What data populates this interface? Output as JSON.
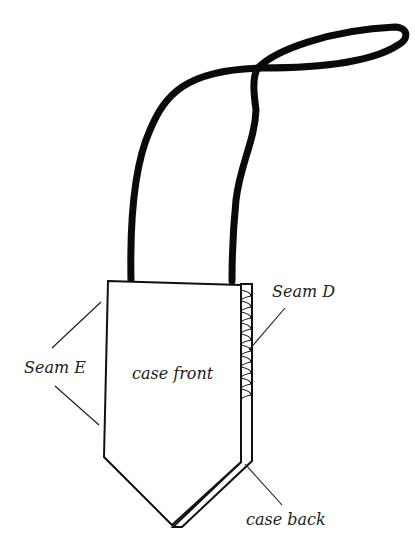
{
  "diagram": {
    "type": "sewing-illustration",
    "colors": {
      "background": "#ffffff",
      "ink": "#111111",
      "label_text": "#222222"
    },
    "labels": {
      "seam_d": "Seam D",
      "seam_e": "Seam E",
      "case_front": "case front",
      "case_back": "case back"
    },
    "parts": [
      "strap",
      "case-front",
      "case-back",
      "seam-d-stitching",
      "seam-e-edges"
    ]
  }
}
